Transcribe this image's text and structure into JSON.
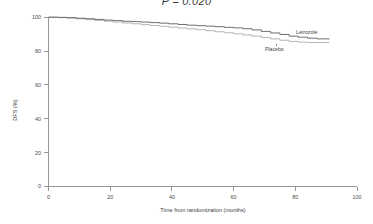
{
  "figure": {
    "title": "P = 0.020",
    "title_statistic_symbol": "P",
    "title_value": "0.020",
    "background_color": "#ffffff"
  },
  "axes": {
    "y_axis_title": "DFS (%)",
    "x_axis_title": "Time from randomization (months)",
    "y_ticks": [
      "0",
      "20",
      "40",
      "60",
      "80",
      "100"
    ],
    "x_ticks": [
      "0",
      "20",
      "40",
      "60",
      "80",
      "100"
    ]
  },
  "series_labels": {
    "letrozole": "Letrozole",
    "placebo": "Placebo"
  },
  "chart_data": {
    "type": "line",
    "title": "P = 0.020",
    "subtitle": "",
    "xlabel": "Time from randomization (months)",
    "ylabel": "DFS (%)",
    "xlim": [
      0,
      100
    ],
    "ylim": [
      0,
      100
    ],
    "x_ticks": [
      0,
      20,
      40,
      60,
      80,
      100
    ],
    "y_ticks": [
      0,
      20,
      40,
      60,
      80,
      100
    ],
    "grid": false,
    "legend_position": "inline-right-of-curve-ends",
    "annotations": [
      {
        "text": "Letrozole",
        "x": 92,
        "y": 89.5
      },
      {
        "text": "Placebo",
        "x": 78,
        "y": 81.5
      },
      {
        "text": "P = 0.020",
        "x": 50,
        "y": 103
      }
    ],
    "series": [
      {
        "name": "Letrozole",
        "color": "#555555",
        "step": "post",
        "x": [
          0,
          3,
          6,
          9,
          12,
          15,
          18,
          21,
          24,
          27,
          30,
          33,
          36,
          39,
          42,
          45,
          48,
          51,
          54,
          57,
          60,
          63,
          66,
          69,
          72,
          75,
          78,
          81,
          84,
          87,
          91
        ],
        "values": [
          100,
          99.9,
          99.7,
          99.4,
          99.1,
          98.7,
          98.3,
          98.0,
          97.6,
          97.4,
          97.1,
          96.8,
          96.5,
          96.1,
          95.7,
          95.3,
          95.0,
          94.7,
          94.4,
          94.0,
          93.7,
          93.2,
          92.5,
          91.6,
          90.7,
          89.8,
          88.8,
          88.2,
          87.6,
          87.2,
          87.0
        ]
      },
      {
        "name": "Placebo",
        "color": "#a8a8a8",
        "step": "post",
        "x": [
          0,
          3,
          6,
          9,
          12,
          15,
          18,
          21,
          24,
          27,
          30,
          33,
          36,
          39,
          42,
          45,
          48,
          51,
          54,
          57,
          60,
          63,
          66,
          69,
          72,
          75,
          78,
          81,
          84,
          87,
          91
        ],
        "values": [
          100,
          99.8,
          99.5,
          99.1,
          98.6,
          98.1,
          97.6,
          97.1,
          96.6,
          96.1,
          95.6,
          95.1,
          94.6,
          94.1,
          93.6,
          93.1,
          92.6,
          92.0,
          91.4,
          90.8,
          90.2,
          89.5,
          88.8,
          88.0,
          87.2,
          86.4,
          85.7,
          85.3,
          85.1,
          85.0,
          85.0
        ]
      }
    ]
  }
}
